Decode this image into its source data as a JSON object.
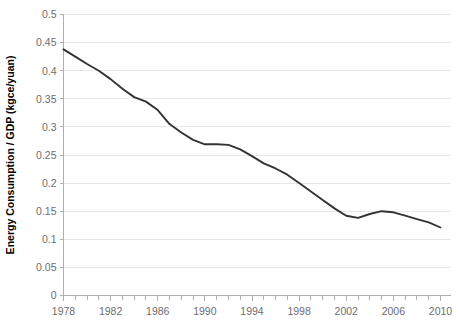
{
  "chart_data": {
    "type": "line",
    "title": "",
    "xlabel": "",
    "ylabel": "Energy Consumption / GDP (kgce/yuan)",
    "xlim": [
      1978,
      2010
    ],
    "ylim": [
      0,
      0.5
    ],
    "grid": true,
    "grid_axis": "y",
    "legend": "none",
    "line_color": "#333333",
    "grid_color": "#e8e8e8",
    "axis_color": "#b0b0b0",
    "tick_label_color": "#6e6e6e",
    "x_tick_labels": [
      "1978",
      "1982",
      "1986",
      "1990",
      "1994",
      "1998",
      "2002",
      "2006",
      "2010"
    ],
    "x_tick_values": [
      1978,
      1982,
      1986,
      1990,
      1994,
      1998,
      2002,
      2006,
      2010
    ],
    "x_minor_tick_interval": 1,
    "y_tick_labels": [
      "0",
      "0.05",
      "0.1",
      "0.15",
      "0.2",
      "0.25",
      "0.3",
      "0.35",
      "0.4",
      "0.45",
      "0.5"
    ],
    "y_tick_values": [
      0,
      0.05,
      0.1,
      0.15,
      0.2,
      0.25,
      0.3,
      0.35,
      0.4,
      0.45,
      0.5
    ],
    "x": [
      1978,
      1979,
      1980,
      1981,
      1982,
      1983,
      1984,
      1985,
      1986,
      1987,
      1988,
      1989,
      1990,
      1991,
      1992,
      1993,
      1994,
      1995,
      1996,
      1997,
      1998,
      1999,
      2000,
      2001,
      2002,
      2003,
      2004,
      2005,
      2006,
      2007,
      2008,
      2009,
      2010
    ],
    "values": [
      0.438,
      0.425,
      0.412,
      0.4,
      0.385,
      0.368,
      0.353,
      0.345,
      0.33,
      0.305,
      0.29,
      0.277,
      0.269,
      0.269,
      0.268,
      0.26,
      0.248,
      0.235,
      0.226,
      0.215,
      0.2,
      0.185,
      0.17,
      0.155,
      0.142,
      0.138,
      0.145,
      0.15,
      0.148,
      0.142,
      0.136,
      0.13,
      0.121
    ],
    "series": [
      {
        "name": "Energy Consumption / GDP",
        "values": [
          0.438,
          0.425,
          0.412,
          0.4,
          0.385,
          0.368,
          0.353,
          0.345,
          0.33,
          0.305,
          0.29,
          0.277,
          0.269,
          0.269,
          0.268,
          0.26,
          0.248,
          0.235,
          0.226,
          0.215,
          0.2,
          0.185,
          0.17,
          0.155,
          0.142,
          0.138,
          0.145,
          0.15,
          0.148,
          0.142,
          0.136,
          0.13,
          0.121
        ]
      }
    ]
  }
}
